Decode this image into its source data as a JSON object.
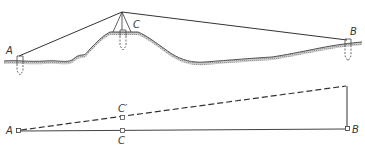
{
  "figure": {
    "colors": {
      "ink": "#333333",
      "terrain_shade": "#aaaaaa",
      "background": "#ffffff"
    }
  },
  "profile": {
    "labels": {
      "a": "A",
      "b": "B",
      "c": "C"
    },
    "stations": [
      {
        "id": "A",
        "x": 20,
        "ground_y": 60
      },
      {
        "id": "C",
        "x": 123,
        "ground_y": 32
      },
      {
        "id": "B",
        "x": 348,
        "ground_y": 42
      }
    ]
  },
  "schematic": {
    "labels": {
      "a": "A",
      "b": "B",
      "c": "C",
      "c_prime": "C′"
    },
    "lines": [
      {
        "name": "base-line",
        "style": "solid",
        "from": "A",
        "to": "B"
      },
      {
        "name": "sight-line",
        "style": "dashed",
        "from": "A",
        "to": "B-top"
      },
      {
        "name": "vertical-offset",
        "style": "solid",
        "from": "B",
        "to": "B-top"
      }
    ]
  }
}
